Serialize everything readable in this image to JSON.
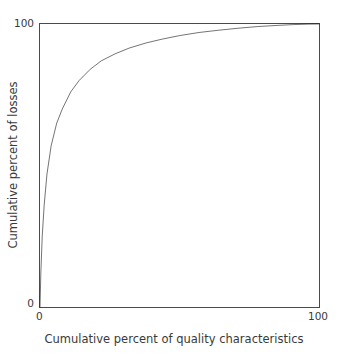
{
  "figure": {
    "background_color": "#ffffff",
    "frame_color": "#4a4a4a",
    "curve_color": "#000000"
  },
  "axes": {
    "x_title": "Cumulative percent of quality characteristics",
    "y_title": "Cumulative percent of losses",
    "x_ticks": [
      "0",
      "100"
    ],
    "y_ticks": [
      "0",
      "100"
    ]
  },
  "chart_data": {
    "type": "line",
    "title": "",
    "subtitle": "",
    "xlabel": "Cumulative percent of quality characteristics",
    "ylabel": "Cumulative percent of losses",
    "xlim": [
      0,
      100
    ],
    "ylim": [
      0,
      100
    ],
    "xticks": [
      0,
      100
    ],
    "yticks": [
      0,
      100
    ],
    "xticklabels": [
      "0",
      "100"
    ],
    "yticklabels": [
      "0",
      "100"
    ],
    "grid": false,
    "legend": false,
    "legend_position": "none",
    "annotations": [],
    "series": [
      {
        "name": "Cumulative loss curve",
        "color": "#000000",
        "line_width": 1.5,
        "x": [
          0,
          0.3,
          0.8,
          1.5,
          2.5,
          4,
          6,
          8,
          11,
          14,
          18,
          22,
          27,
          32,
          38,
          44,
          50,
          57,
          64,
          71,
          78,
          85,
          91,
          96,
          100
        ],
        "y": [
          0,
          12,
          25,
          36,
          47,
          57,
          65,
          70,
          76,
          80,
          84,
          87,
          89.5,
          91.5,
          93.3,
          94.7,
          95.9,
          97,
          97.8,
          98.5,
          99.1,
          99.5,
          99.8,
          99.95,
          100
        ]
      }
    ]
  }
}
